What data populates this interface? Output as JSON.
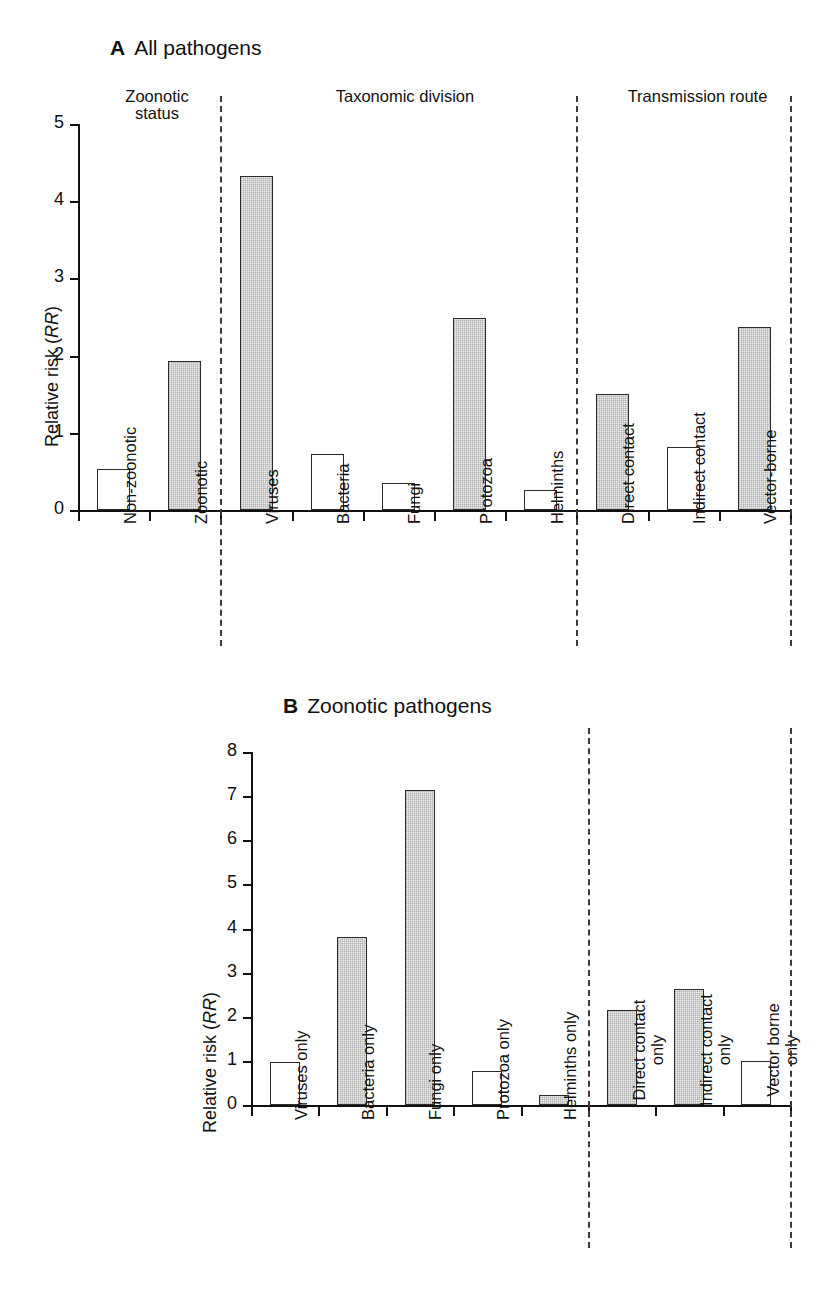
{
  "figure": {
    "y_axis_label_text": "Relative risk (",
    "y_axis_label_italic": "RR",
    "y_axis_label_close": ")"
  },
  "panels": [
    {
      "id": "A",
      "letter": "A",
      "title": "All pathogens",
      "group_headers": [
        {
          "line1": "Zoonotic",
          "line2": "status"
        },
        {
          "line1": "Taxonomic division",
          "line2": ""
        },
        {
          "line1": "Transmission route",
          "line2": ""
        }
      ],
      "ylabel": "Relative risk (RR)",
      "yticks": [
        "0",
        "1",
        "2",
        "3",
        "4",
        "5"
      ]
    },
    {
      "id": "B",
      "letter": "B",
      "title": "Zoonotic pathogens",
      "group_headers": [],
      "ylabel": "Relative risk (RR)",
      "yticks": [
        "0",
        "1",
        "2",
        "3",
        "4",
        "5",
        "6",
        "7",
        "8"
      ]
    }
  ],
  "chart_data": [
    {
      "type": "bar",
      "title": "A  All pathogens",
      "xlabel": "",
      "ylabel": "Relative risk (RR)",
      "ylim": [
        0,
        5
      ],
      "yticks": [
        0,
        1,
        2,
        3,
        4,
        5
      ],
      "grid": false,
      "legend": "none",
      "groups": [
        "Zoonotic status",
        "Taxonomic division",
        "Transmission route"
      ],
      "categories": [
        "Non-zoonotic",
        "Zoonotic",
        "Viruses",
        "Bacteria",
        "Fungi",
        "Protozoa",
        "Helminths",
        "Direct contact",
        "Indirect contact",
        "Vector-borne"
      ],
      "values": [
        0.53,
        1.93,
        4.33,
        0.72,
        0.35,
        2.49,
        0.26,
        1.5,
        0.82,
        2.37
      ],
      "fills": [
        "open",
        "shaded",
        "shaded",
        "open",
        "open",
        "shaded",
        "open",
        "shaded",
        "open",
        "shaded"
      ],
      "group_of_category": [
        0,
        0,
        1,
        1,
        1,
        1,
        1,
        2,
        2,
        2
      ]
    },
    {
      "type": "bar",
      "title": "B  Zoonotic pathogens",
      "xlabel": "",
      "ylabel": "Relative risk (RR)",
      "ylim": [
        0,
        8
      ],
      "yticks": [
        0,
        1,
        2,
        3,
        4,
        5,
        6,
        7,
        8
      ],
      "grid": false,
      "legend": "none",
      "groups": [
        "Taxonomic division",
        "Transmission route"
      ],
      "categories": [
        "Viruses only",
        "Bacteria only",
        "Fungi only",
        "Protozoa only",
        "Helminths only",
        "Direct contact only",
        "Indirect contact only",
        "Vector borne only"
      ],
      "values": [
        0.97,
        3.8,
        7.15,
        0.76,
        0.22,
        2.15,
        2.62,
        1.0
      ],
      "fills": [
        "open",
        "shaded",
        "shaded",
        "open",
        "shaded",
        "shaded",
        "shaded",
        "open"
      ],
      "group_of_category": [
        0,
        0,
        0,
        0,
        0,
        1,
        1,
        1
      ]
    }
  ],
  "colors": {
    "shaded_fill": "#ededed",
    "bar_outline": "#2b2b2b",
    "axis": "#111111",
    "divider": "#3a3a3a"
  }
}
